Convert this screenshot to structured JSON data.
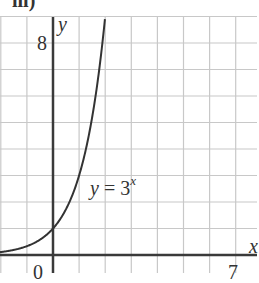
{
  "part_label": "iii)",
  "chart_data": {
    "type": "line",
    "title": "",
    "function": "y = 3^x",
    "xlabel": "x",
    "ylabel": "y",
    "xlim": [
      -2,
      7.8
    ],
    "ylim": [
      -0.7,
      9.5
    ],
    "tick_labels": {
      "x": [
        "0",
        "7"
      ],
      "y": [
        "8"
      ]
    },
    "grid": true,
    "grid_step": 1,
    "series": [
      {
        "name": "y = 3^x",
        "x": [
          -2,
          -1.5,
          -1,
          -0.5,
          0,
          0.5,
          1,
          1.5,
          2
        ],
        "values": [
          0.11,
          0.19,
          0.33,
          0.58,
          1,
          1.73,
          3,
          5.2,
          9
        ]
      }
    ],
    "annotations": [
      {
        "text": "y = 3^x",
        "x": 1.4,
        "y": 2.4
      }
    ],
    "colors": {
      "grid": "#c8c8c8",
      "axis": "#3a3a3a",
      "curve": "#333333"
    }
  },
  "labels": {
    "y_axis": "y",
    "x_axis": "x",
    "tick_0": "0",
    "tick_7": "7",
    "tick_8": "8",
    "curve_lhs": "y",
    "curve_eq": " = 3",
    "curve_exp": "x"
  }
}
